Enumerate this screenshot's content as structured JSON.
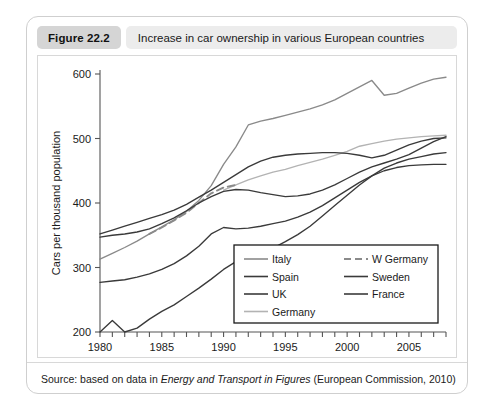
{
  "figure": {
    "number_label": "Figure 22.2",
    "title": "Increase in car ownership in various European countries"
  },
  "source": {
    "prefix": "Source: based on data in ",
    "italic_title": "Energy and Transport in Figures",
    "suffix": " (European Commission, 2010)"
  },
  "colors": {
    "dark_line": "#3a3a3a",
    "mid_gray_line": "#8a8a8a",
    "light_gray_line": "#b3b3b3",
    "axis": "#555555",
    "header_badge": "#d5d5d5",
    "header_title_bg": "#ececec",
    "card_border": "#cfcfcf"
  },
  "chart_data": {
    "type": "line",
    "title": "Increase in car ownership in various European countries",
    "xlabel": "",
    "ylabel": "Cars per thousand population",
    "xlim": [
      1980,
      2008
    ],
    "ylim": [
      200,
      600
    ],
    "yticks": [
      200,
      300,
      400,
      500,
      600
    ],
    "xticks": [
      1980,
      1981,
      1982,
      1983,
      1984,
      1985,
      1986,
      1987,
      1988,
      1989,
      1990,
      1991,
      1992,
      1993,
      1994,
      1995,
      1996,
      1997,
      1998,
      1999,
      2000,
      2001,
      2002,
      2003,
      2004,
      2005,
      2006,
      2007,
      2008
    ],
    "xtick_labels": [
      1980,
      1985,
      1990,
      1995,
      2000,
      2005
    ],
    "grid": false,
    "legend_position": "inside-bottom-right",
    "series": [
      {
        "name": "Italy",
        "color": "#8a8a8a",
        "style": "solid",
        "x": [
          1980,
          1981,
          1982,
          1983,
          1984,
          1985,
          1986,
          1987,
          1988,
          1989,
          1990,
          1991,
          1992,
          1993,
          1994,
          1995,
          1996,
          1997,
          1998,
          1999,
          2000,
          2001,
          2002,
          2003,
          2004,
          2005,
          2006,
          2007,
          2008
        ],
        "y": [
          313,
          322,
          331,
          341,
          352,
          363,
          374,
          387,
          404,
          427,
          460,
          487,
          521,
          527,
          531,
          536,
          541,
          546,
          552,
          560,
          570,
          580,
          590,
          567,
          570,
          578,
          586,
          592,
          595
        ]
      },
      {
        "name": "Spain",
        "color": "#3a3a3a",
        "style": "solid",
        "x": [
          1980,
          1981,
          1982,
          1983,
          1984,
          1985,
          1986,
          1987,
          1988,
          1989,
          1990,
          1991,
          1992,
          1993,
          1994,
          1995,
          1996,
          1997,
          1998,
          1999,
          2000,
          2001,
          2002,
          2003,
          2004,
          2005,
          2006,
          2007,
          2008
        ],
        "y": [
          200,
          218,
          200,
          206,
          220,
          232,
          242,
          255,
          268,
          282,
          297,
          309,
          318,
          324,
          330,
          340,
          351,
          364,
          380,
          396,
          412,
          428,
          442,
          454,
          462,
          468,
          472,
          476,
          478
        ]
      },
      {
        "name": "UK",
        "color": "#3a3a3a",
        "style": "solid",
        "x": [
          1980,
          1981,
          1982,
          1983,
          1984,
          1985,
          1986,
          1987,
          1988,
          1989,
          1990,
          1991,
          1992,
          1993,
          1994,
          1995,
          1996,
          1997,
          1998,
          1999,
          2000,
          2001,
          2002,
          2003,
          2004,
          2005,
          2006,
          2007,
          2008
        ],
        "y": [
          277,
          279,
          281,
          285,
          290,
          297,
          306,
          318,
          333,
          352,
          362,
          360,
          361,
          364,
          368,
          372,
          378,
          386,
          396,
          408,
          420,
          432,
          442,
          450,
          455,
          458,
          459,
          460,
          460
        ]
      },
      {
        "name": "Germany",
        "color": "#b3b3b3",
        "style": "solid",
        "x": [
          1990,
          1991,
          1992,
          1993,
          1994,
          1995,
          1996,
          1997,
          1998,
          1999,
          2000,
          2001,
          2002,
          2003,
          2004,
          2005,
          2006,
          2007,
          2008
        ],
        "y": [
          420,
          428,
          436,
          442,
          448,
          452,
          458,
          463,
          468,
          474,
          480,
          488,
          492,
          496,
          499,
          501,
          503,
          504,
          505
        ]
      },
      {
        "name": "W Germany",
        "color": "#8a8a8a",
        "style": "dashed",
        "x": [
          1984,
          1985,
          1986,
          1987,
          1988,
          1989,
          1990,
          1991
        ],
        "y": [
          352,
          362,
          373,
          385,
          400,
          415,
          424,
          428
        ]
      },
      {
        "name": "Sweden",
        "color": "#3a3a3a",
        "style": "solid",
        "x": [
          1980,
          1981,
          1982,
          1983,
          1984,
          1985,
          1986,
          1987,
          1988,
          1989,
          1990,
          1991,
          1992,
          1993,
          1994,
          1995,
          1996,
          1997,
          1998,
          1999,
          2000,
          2001,
          2002,
          2003,
          2004,
          2005,
          2006,
          2007,
          2008
        ],
        "y": [
          347,
          350,
          352,
          355,
          360,
          368,
          377,
          388,
          400,
          410,
          418,
          421,
          420,
          416,
          413,
          410,
          411,
          414,
          420,
          428,
          438,
          448,
          456,
          462,
          468,
          475,
          485,
          495,
          503
        ]
      },
      {
        "name": "France",
        "color": "#3a3a3a",
        "style": "solid",
        "x": [
          1980,
          1981,
          1982,
          1983,
          1984,
          1985,
          1986,
          1987,
          1988,
          1989,
          1990,
          1991,
          1992,
          1993,
          1994,
          1995,
          1996,
          1997,
          1998,
          1999,
          2000,
          2001,
          2002,
          2003,
          2004,
          2005,
          2006,
          2007,
          2008
        ],
        "y": [
          352,
          358,
          364,
          370,
          376,
          382,
          389,
          398,
          409,
          420,
          432,
          444,
          456,
          465,
          471,
          474,
          476,
          477,
          478,
          478,
          477,
          474,
          470,
          474,
          482,
          490,
          496,
          500,
          501
        ]
      }
    ],
    "legend": [
      {
        "name": "Italy",
        "color": "#8a8a8a",
        "style": "solid",
        "column": 0
      },
      {
        "name": "Spain",
        "color": "#3a3a3a",
        "style": "solid",
        "column": 0
      },
      {
        "name": "UK",
        "color": "#3a3a3a",
        "style": "solid",
        "column": 0
      },
      {
        "name": "Germany",
        "color": "#b3b3b3",
        "style": "solid",
        "column": 0
      },
      {
        "name": "W Germany",
        "color": "#8a8a8a",
        "style": "dashed",
        "column": 1
      },
      {
        "name": "Sweden",
        "color": "#3a3a3a",
        "style": "solid",
        "column": 1
      },
      {
        "name": "France",
        "color": "#3a3a3a",
        "style": "solid",
        "column": 1
      }
    ]
  }
}
